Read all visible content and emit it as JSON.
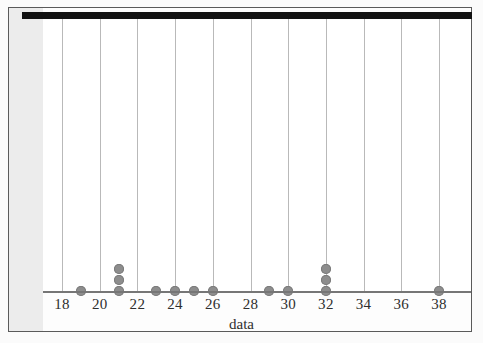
{
  "figure": {
    "axis_title": "data",
    "dot_color": "#8d8d8d",
    "gridline_color": "#b9b9b9",
    "axis_color": "#767676",
    "frame_color": "#5a5a5a",
    "top_bar_color": "#121212",
    "background": "#ffffff",
    "margin_strip_color": "#ececec"
  },
  "chart_data": {
    "type": "scatter",
    "plot_style": "dotplot",
    "title": "",
    "subtitle": "",
    "xlabel": "data",
    "ylabel": "",
    "grid": true,
    "legend": null,
    "xlim": [
      17,
      39
    ],
    "xtick_labels": [
      "18",
      "20",
      "22",
      "24",
      "26",
      "28",
      "30",
      "32",
      "34",
      "36",
      "38"
    ],
    "xticks": [
      18,
      20,
      22,
      24,
      26,
      28,
      30,
      32,
      34,
      36,
      38
    ],
    "tick_interval": 2,
    "dot_unit": 1,
    "categories": [
      19,
      21,
      23,
      24,
      25,
      26,
      29,
      30,
      32,
      38
    ],
    "values": [
      1,
      3,
      1,
      1,
      1,
      1,
      1,
      1,
      3,
      1
    ],
    "observations": [
      19,
      21,
      21,
      21,
      23,
      24,
      25,
      26,
      29,
      30,
      32,
      32,
      32,
      38
    ],
    "n": 14,
    "stacks": [
      {
        "x": 19,
        "count": 1
      },
      {
        "x": 21,
        "count": 3
      },
      {
        "x": 23,
        "count": 1
      },
      {
        "x": 24,
        "count": 1
      },
      {
        "x": 25,
        "count": 1
      },
      {
        "x": 26,
        "count": 1
      },
      {
        "x": 29,
        "count": 1
      },
      {
        "x": 30,
        "count": 1
      },
      {
        "x": 32,
        "count": 3
      },
      {
        "x": 38,
        "count": 1
      }
    ]
  }
}
